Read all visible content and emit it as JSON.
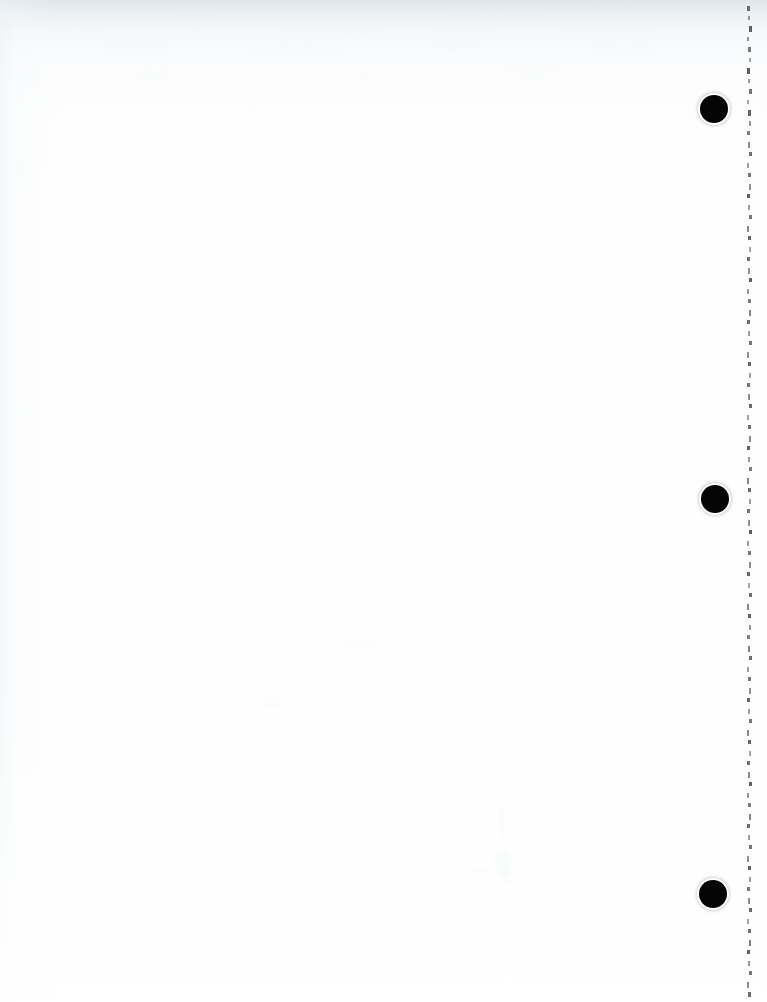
{
  "document": {
    "kind": "scanned-page",
    "page_content": "",
    "page_note": "blank page",
    "width": 767,
    "height": 1002,
    "background_color": "#fefefe",
    "paper_tint_color": "#eef2f6",
    "ink_color": "#050505"
  },
  "punch_holes": {
    "count": 3,
    "diameter": 28,
    "color": "#050505",
    "items": [
      {
        "name": "punch-hole-top",
        "cx": 714,
        "cy": 109,
        "d": 28
      },
      {
        "name": "punch-hole-middle",
        "cx": 715,
        "cy": 499,
        "d": 28
      },
      {
        "name": "punch-hole-bottom",
        "cx": 713,
        "cy": 894,
        "d": 28
      }
    ]
  },
  "edge_artifacts": {
    "name": "right-edge-scan-artifacts",
    "x": 746,
    "width": 8,
    "color": "#3a3a3a",
    "spacing": 10,
    "ticks": [
      {
        "y": 6,
        "h": 5,
        "w": 3,
        "o": 0.72
      },
      {
        "y": 16,
        "h": 4,
        "w": 2,
        "o": 0.5
      },
      {
        "y": 26,
        "h": 6,
        "w": 3,
        "o": 0.8
      },
      {
        "y": 37,
        "h": 4,
        "w": 2,
        "o": 0.55
      },
      {
        "y": 47,
        "h": 5,
        "w": 3,
        "o": 0.68
      },
      {
        "y": 58,
        "h": 4,
        "w": 2,
        "o": 0.45
      },
      {
        "y": 68,
        "h": 6,
        "w": 3,
        "o": 0.82
      },
      {
        "y": 79,
        "h": 4,
        "w": 2,
        "o": 0.5
      },
      {
        "y": 89,
        "h": 5,
        "w": 3,
        "o": 0.7
      },
      {
        "y": 100,
        "h": 4,
        "w": 2,
        "o": 0.44
      },
      {
        "y": 110,
        "h": 6,
        "w": 3,
        "o": 0.78
      },
      {
        "y": 121,
        "h": 5,
        "w": 2,
        "o": 0.52
      },
      {
        "y": 131,
        "h": 4,
        "w": 3,
        "o": 0.66
      },
      {
        "y": 142,
        "h": 6,
        "w": 2,
        "o": 0.58
      },
      {
        "y": 152,
        "h": 4,
        "w": 3,
        "o": 0.74
      },
      {
        "y": 163,
        "h": 5,
        "w": 2,
        "o": 0.48
      },
      {
        "y": 173,
        "h": 4,
        "w": 3,
        "o": 0.7
      },
      {
        "y": 184,
        "h": 6,
        "w": 2,
        "o": 0.55
      },
      {
        "y": 194,
        "h": 4,
        "w": 3,
        "o": 0.8
      },
      {
        "y": 205,
        "h": 5,
        "w": 2,
        "o": 0.5
      },
      {
        "y": 215,
        "h": 4,
        "w": 3,
        "o": 0.68
      },
      {
        "y": 226,
        "h": 6,
        "w": 2,
        "o": 0.6
      },
      {
        "y": 236,
        "h": 4,
        "w": 3,
        "o": 0.76
      },
      {
        "y": 247,
        "h": 5,
        "w": 2,
        "o": 0.46
      },
      {
        "y": 257,
        "h": 4,
        "w": 3,
        "o": 0.72
      },
      {
        "y": 268,
        "h": 6,
        "w": 2,
        "o": 0.54
      },
      {
        "y": 278,
        "h": 4,
        "w": 3,
        "o": 0.8
      },
      {
        "y": 289,
        "h": 5,
        "w": 2,
        "o": 0.5
      },
      {
        "y": 299,
        "h": 4,
        "w": 3,
        "o": 0.66
      },
      {
        "y": 310,
        "h": 6,
        "w": 2,
        "o": 0.62
      },
      {
        "y": 320,
        "h": 4,
        "w": 3,
        "o": 0.74
      },
      {
        "y": 331,
        "h": 5,
        "w": 2,
        "o": 0.48
      },
      {
        "y": 341,
        "h": 4,
        "w": 3,
        "o": 0.7
      },
      {
        "y": 352,
        "h": 6,
        "w": 2,
        "o": 0.56
      },
      {
        "y": 362,
        "h": 4,
        "w": 3,
        "o": 0.78
      },
      {
        "y": 373,
        "h": 5,
        "w": 2,
        "o": 0.5
      },
      {
        "y": 383,
        "h": 4,
        "w": 3,
        "o": 0.68
      },
      {
        "y": 394,
        "h": 6,
        "w": 2,
        "o": 0.58
      },
      {
        "y": 404,
        "h": 4,
        "w": 3,
        "o": 0.76
      },
      {
        "y": 415,
        "h": 5,
        "w": 2,
        "o": 0.46
      },
      {
        "y": 425,
        "h": 4,
        "w": 3,
        "o": 0.72
      },
      {
        "y": 436,
        "h": 6,
        "w": 2,
        "o": 0.6
      },
      {
        "y": 446,
        "h": 4,
        "w": 3,
        "o": 0.8
      },
      {
        "y": 457,
        "h": 5,
        "w": 2,
        "o": 0.52
      },
      {
        "y": 467,
        "h": 4,
        "w": 3,
        "o": 0.66
      },
      {
        "y": 478,
        "h": 6,
        "w": 2,
        "o": 0.62
      },
      {
        "y": 488,
        "h": 4,
        "w": 3,
        "o": 0.74
      },
      {
        "y": 499,
        "h": 5,
        "w": 2,
        "o": 0.48
      },
      {
        "y": 509,
        "h": 4,
        "w": 3,
        "o": 0.7
      },
      {
        "y": 520,
        "h": 6,
        "w": 2,
        "o": 0.56
      },
      {
        "y": 530,
        "h": 4,
        "w": 3,
        "o": 0.82
      },
      {
        "y": 541,
        "h": 5,
        "w": 2,
        "o": 0.5
      },
      {
        "y": 551,
        "h": 4,
        "w": 3,
        "o": 0.68
      },
      {
        "y": 562,
        "h": 6,
        "w": 2,
        "o": 0.58
      },
      {
        "y": 572,
        "h": 4,
        "w": 3,
        "o": 0.76
      },
      {
        "y": 583,
        "h": 5,
        "w": 2,
        "o": 0.44
      },
      {
        "y": 593,
        "h": 4,
        "w": 3,
        "o": 0.72
      },
      {
        "y": 604,
        "h": 6,
        "w": 2,
        "o": 0.6
      },
      {
        "y": 614,
        "h": 4,
        "w": 3,
        "o": 0.8
      },
      {
        "y": 625,
        "h": 5,
        "w": 2,
        "o": 0.52
      },
      {
        "y": 635,
        "h": 4,
        "w": 3,
        "o": 0.66
      },
      {
        "y": 646,
        "h": 6,
        "w": 2,
        "o": 0.64
      },
      {
        "y": 656,
        "h": 4,
        "w": 3,
        "o": 0.74
      },
      {
        "y": 667,
        "h": 5,
        "w": 2,
        "o": 0.48
      },
      {
        "y": 677,
        "h": 4,
        "w": 3,
        "o": 0.7
      },
      {
        "y": 688,
        "h": 6,
        "w": 2,
        "o": 0.56
      },
      {
        "y": 698,
        "h": 4,
        "w": 3,
        "o": 0.78
      },
      {
        "y": 709,
        "h": 5,
        "w": 2,
        "o": 0.5
      },
      {
        "y": 719,
        "h": 4,
        "w": 3,
        "o": 0.68
      },
      {
        "y": 730,
        "h": 6,
        "w": 2,
        "o": 0.6
      },
      {
        "y": 740,
        "h": 4,
        "w": 3,
        "o": 0.76
      },
      {
        "y": 751,
        "h": 5,
        "w": 2,
        "o": 0.46
      },
      {
        "y": 761,
        "h": 4,
        "w": 3,
        "o": 0.72
      },
      {
        "y": 772,
        "h": 6,
        "w": 2,
        "o": 0.58
      },
      {
        "y": 782,
        "h": 4,
        "w": 3,
        "o": 0.8
      },
      {
        "y": 793,
        "h": 5,
        "w": 2,
        "o": 0.52
      },
      {
        "y": 803,
        "h": 4,
        "w": 3,
        "o": 0.66
      },
      {
        "y": 814,
        "h": 6,
        "w": 2,
        "o": 0.62
      },
      {
        "y": 824,
        "h": 4,
        "w": 3,
        "o": 0.74
      },
      {
        "y": 835,
        "h": 5,
        "w": 2,
        "o": 0.48
      },
      {
        "y": 845,
        "h": 4,
        "w": 3,
        "o": 0.7
      },
      {
        "y": 856,
        "h": 6,
        "w": 2,
        "o": 0.56
      },
      {
        "y": 866,
        "h": 4,
        "w": 3,
        "o": 0.82
      },
      {
        "y": 877,
        "h": 5,
        "w": 2,
        "o": 0.5
      },
      {
        "y": 887,
        "h": 4,
        "w": 3,
        "o": 0.68
      },
      {
        "y": 898,
        "h": 6,
        "w": 2,
        "o": 0.6
      },
      {
        "y": 908,
        "h": 4,
        "w": 3,
        "o": 0.76
      },
      {
        "y": 919,
        "h": 5,
        "w": 2,
        "o": 0.46
      },
      {
        "y": 929,
        "h": 4,
        "w": 3,
        "o": 0.72
      },
      {
        "y": 940,
        "h": 6,
        "w": 2,
        "o": 0.64
      },
      {
        "y": 950,
        "h": 4,
        "w": 3,
        "o": 0.8
      },
      {
        "y": 961,
        "h": 5,
        "w": 2,
        "o": 0.52
      },
      {
        "y": 971,
        "h": 4,
        "w": 3,
        "o": 0.7
      },
      {
        "y": 982,
        "h": 6,
        "w": 2,
        "o": 0.58
      },
      {
        "y": 992,
        "h": 5,
        "w": 3,
        "o": 0.74
      }
    ]
  },
  "paper_speckles": [
    {
      "x": 40,
      "y": 10,
      "w": 70,
      "h": 16,
      "o": 0.35
    },
    {
      "x": 150,
      "y": 6,
      "w": 90,
      "h": 14,
      "o": 0.3
    },
    {
      "x": 280,
      "y": 12,
      "w": 110,
      "h": 18,
      "o": 0.33
    },
    {
      "x": 430,
      "y": 4,
      "w": 120,
      "h": 16,
      "o": 0.28
    },
    {
      "x": 560,
      "y": 14,
      "w": 100,
      "h": 14,
      "o": 0.3
    },
    {
      "x": 95,
      "y": 36,
      "w": 80,
      "h": 14,
      "o": 0.22
    },
    {
      "x": 250,
      "y": 44,
      "w": 95,
      "h": 16,
      "o": 0.2
    },
    {
      "x": 410,
      "y": 32,
      "w": 85,
      "h": 14,
      "o": 0.24
    },
    {
      "x": 585,
      "y": 40,
      "w": 75,
      "h": 12,
      "o": 0.18
    },
    {
      "x": 120,
      "y": 70,
      "w": 60,
      "h": 12,
      "o": 0.14
    },
    {
      "x": 330,
      "y": 78,
      "w": 70,
      "h": 12,
      "o": 0.12
    },
    {
      "x": 500,
      "y": 66,
      "w": 65,
      "h": 12,
      "o": 0.13
    },
    {
      "x": 8,
      "y": 150,
      "w": 26,
      "h": 40,
      "o": 0.13
    },
    {
      "x": 6,
      "y": 260,
      "w": 22,
      "h": 50,
      "o": 0.12
    },
    {
      "x": 10,
      "y": 390,
      "w": 24,
      "h": 44,
      "o": 0.11
    },
    {
      "x": 5,
      "y": 520,
      "w": 20,
      "h": 46,
      "o": 0.1
    },
    {
      "x": 9,
      "y": 650,
      "w": 22,
      "h": 40,
      "o": 0.09
    },
    {
      "x": 290,
      "y": 300,
      "w": 40,
      "h": 12,
      "o": 0.08
    },
    {
      "x": 460,
      "y": 250,
      "w": 34,
      "h": 10,
      "o": 0.07
    },
    {
      "x": 620,
      "y": 420,
      "w": 30,
      "h": 10,
      "o": 0.07
    }
  ],
  "bleed_marks": [
    {
      "x": 498,
      "y": 806,
      "w": 7,
      "h": 22,
      "o": 0.13,
      "c": "#aab8bd"
    },
    {
      "x": 500,
      "y": 828,
      "w": 5,
      "h": 12,
      "o": 0.09,
      "c": "#b6c2c6"
    },
    {
      "x": 494,
      "y": 852,
      "w": 16,
      "h": 9,
      "o": 0.16,
      "c": "#9fb2b6"
    },
    {
      "x": 497,
      "y": 861,
      "w": 13,
      "h": 14,
      "o": 0.18,
      "c": "#93a9ad"
    },
    {
      "x": 503,
      "y": 872,
      "w": 9,
      "h": 10,
      "o": 0.12,
      "c": "#a8b8bc"
    },
    {
      "x": 470,
      "y": 868,
      "w": 22,
      "h": 6,
      "o": 0.08,
      "c": "#b4c0c4"
    },
    {
      "x": 400,
      "y": 878,
      "w": 28,
      "h": 5,
      "o": 0.06,
      "c": "#bcc6ca"
    },
    {
      "x": 540,
      "y": 886,
      "w": 24,
      "h": 5,
      "o": 0.06,
      "c": "#bcc6ca"
    },
    {
      "x": 345,
      "y": 640,
      "w": 30,
      "h": 8,
      "o": 0.05,
      "c": "#c2ccd0"
    },
    {
      "x": 260,
      "y": 700,
      "w": 26,
      "h": 7,
      "o": 0.05,
      "c": "#c2ccd0"
    }
  ]
}
